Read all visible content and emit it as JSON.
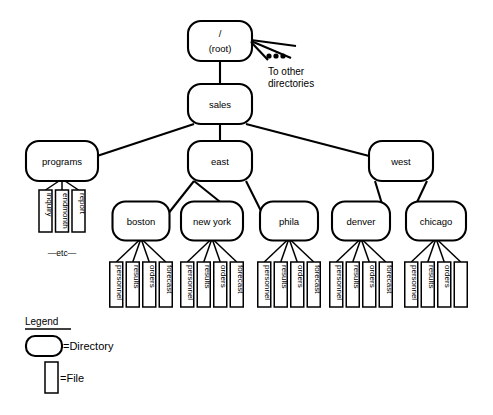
{
  "diagram": {
    "root": {
      "id": "root",
      "label_line1": "/",
      "label_line2": "(root)",
      "type": "directory"
    },
    "annotation": {
      "line1": "To other",
      "line2": "directories",
      "ellipsis": "•••"
    },
    "etc_label": "—etc—",
    "directories": [
      {
        "id": "root",
        "label": "/ (root)",
        "x": 220,
        "y": 41,
        "w": 64,
        "h": 40
      },
      {
        "id": "sales",
        "label": "sales",
        "x": 220,
        "y": 104,
        "w": 64,
        "h": 40
      },
      {
        "id": "programs",
        "label": "programs",
        "x": 62,
        "y": 161,
        "w": 72,
        "h": 40
      },
      {
        "id": "east",
        "label": "east",
        "x": 220,
        "y": 161,
        "w": 64,
        "h": 40
      },
      {
        "id": "west",
        "label": "west",
        "x": 401,
        "y": 161,
        "w": 64,
        "h": 40
      },
      {
        "id": "boston",
        "label": "boston",
        "x": 141,
        "y": 221,
        "w": 57,
        "h": 39
      },
      {
        "id": "newyork",
        "label": "new york",
        "x": 212,
        "y": 221,
        "w": 62,
        "h": 39
      },
      {
        "id": "phila",
        "label": "phila",
        "x": 289,
        "y": 221,
        "w": 58,
        "h": 39
      },
      {
        "id": "denver",
        "label": "denver",
        "x": 361,
        "y": 221,
        "w": 58,
        "h": 39
      },
      {
        "id": "chicago",
        "label": "chicago",
        "x": 436,
        "y": 221,
        "w": 60,
        "h": 39
      }
    ],
    "edges": [
      {
        "from": "root",
        "to": "sales"
      },
      {
        "from": "sales",
        "to": "programs"
      },
      {
        "from": "sales",
        "to": "east"
      },
      {
        "from": "sales",
        "to": "west"
      },
      {
        "from": "east",
        "to": "boston"
      },
      {
        "from": "east",
        "to": "newyork"
      },
      {
        "from": "east",
        "to": "phila"
      },
      {
        "from": "west",
        "to": "denver"
      },
      {
        "from": "west",
        "to": "chicago"
      }
    ],
    "file_groups": [
      {
        "parent": "programs",
        "cx": 62,
        "files": [
          "inquiry",
          "endmonth",
          "report"
        ]
      },
      {
        "parent": "boston",
        "cx": 141,
        "files": [
          "personnel",
          "results",
          "orders",
          "forecast"
        ]
      },
      {
        "parent": "newyork",
        "cx": 212,
        "files": [
          "personnel",
          "results",
          "orders",
          "forecast"
        ]
      },
      {
        "parent": "phila",
        "cx": 289,
        "files": [
          "personnel",
          "results",
          "orders",
          "forecast"
        ]
      },
      {
        "parent": "denver",
        "cx": 361,
        "files": [
          "personnel",
          "results",
          "orders",
          "forecast"
        ]
      },
      {
        "parent": "chicago",
        "cx": 436,
        "files": [
          "personnel",
          "results",
          "orders",
          ""
        ]
      }
    ],
    "legend": {
      "title": "Legend",
      "directory_label": "=Directory",
      "file_label": "=File"
    },
    "colors": {
      "stroke": "#000000",
      "fill": "#ffffff",
      "background": "#ffffff"
    }
  }
}
